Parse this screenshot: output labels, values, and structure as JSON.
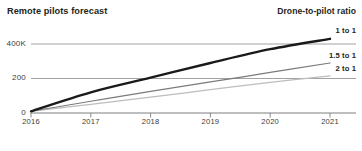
{
  "header": {
    "title_left": "Remote pilots forecast",
    "title_right": "Drone-to-pilot ratio"
  },
  "chart_data": {
    "type": "line",
    "title": "Remote pilots forecast",
    "legend_title": "Drone-to-pilot ratio",
    "legend_position": "right-inline",
    "xlabel": "",
    "ylabel": "",
    "grid": true,
    "x": [
      2016,
      2017,
      2018,
      2019,
      2020,
      2021
    ],
    "xticklabels": [
      "2016",
      "2017",
      "2018",
      "2019",
      "2020",
      "2021"
    ],
    "xlim": [
      2016,
      2021
    ],
    "ylim": [
      0,
      450
    ],
    "yticks": [
      0,
      200,
      400
    ],
    "yticklabels": [
      "0",
      "200",
      "400K"
    ],
    "series": [
      {
        "name": "1 to 1",
        "label": "1 to 1",
        "color": "#1a1a1a",
        "width": 2.4,
        "values": [
          10,
          120,
          205,
          290,
          370,
          430
        ]
      },
      {
        "name": "1.5 to 1",
        "label": "1.5 to 1",
        "color": "#7b7b7b",
        "width": 1.2,
        "values": [
          10,
          68,
          125,
          180,
          235,
          290
        ]
      },
      {
        "name": "2 to 1",
        "label": "2 to 1",
        "color": "#bdbdbd",
        "width": 1.2,
        "values": [
          10,
          50,
          92,
          135,
          178,
          215
        ]
      }
    ]
  }
}
